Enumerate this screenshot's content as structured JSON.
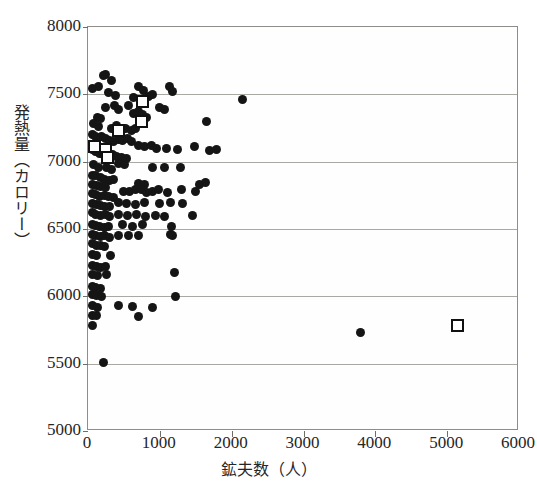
{
  "chart_data": {
    "type": "scatter",
    "title": "",
    "xlabel": "鉱夫数（人）",
    "ylabel": "発熱量（カロリー）",
    "xlim": [
      0,
      6000
    ],
    "ylim": [
      5000,
      8000
    ],
    "xticks": [
      0,
      1000,
      2000,
      3000,
      4000,
      5000,
      6000
    ],
    "yticks": [
      5000,
      5500,
      6000,
      6500,
      7000,
      7500,
      8000
    ],
    "xtick_labels": [
      "0",
      "1000",
      "2000",
      "3000",
      "4000",
      "5000",
      "6000"
    ],
    "ytick_labels": [
      "5000",
      "5500",
      "6000",
      "6500",
      "7000",
      "7500",
      "8000"
    ],
    "grid": "horizontal",
    "legend": [],
    "series": [
      {
        "name": "mines-filled-circle",
        "marker": "filled-circle",
        "color": "#151515",
        "points": [
          [
            60,
            7540
          ],
          [
            215,
            7640
          ],
          [
            250,
            7650
          ],
          [
            330,
            7600
          ],
          [
            140,
            7560
          ],
          [
            290,
            7510
          ],
          [
            380,
            7495
          ],
          [
            700,
            7555
          ],
          [
            770,
            7530
          ],
          [
            640,
            7480
          ],
          [
            840,
            7485
          ],
          [
            900,
            7500
          ],
          [
            1130,
            7560
          ],
          [
            1180,
            7520
          ],
          [
            370,
            7420
          ],
          [
            250,
            7400
          ],
          [
            430,
            7390
          ],
          [
            560,
            7420
          ],
          [
            640,
            7360
          ],
          [
            700,
            7370
          ],
          [
            760,
            7350
          ],
          [
            820,
            7330
          ],
          [
            1000,
            7400
          ],
          [
            1060,
            7390
          ],
          [
            130,
            7330
          ],
          [
            175,
            7320
          ],
          [
            80,
            7280
          ],
          [
            150,
            7260
          ],
          [
            330,
            7250
          ],
          [
            390,
            7270
          ],
          [
            460,
            7240
          ],
          [
            520,
            7250
          ],
          [
            600,
            7230
          ],
          [
            660,
            7250
          ],
          [
            2150,
            7460
          ],
          [
            1650,
            7300
          ],
          [
            60,
            7200
          ],
          [
            110,
            7185
          ],
          [
            185,
            7190
          ],
          [
            240,
            7175
          ],
          [
            300,
            7160
          ],
          [
            360,
            7150
          ],
          [
            420,
            7165
          ],
          [
            480,
            7155
          ],
          [
            545,
            7170
          ],
          [
            610,
            7150
          ],
          [
            700,
            7120
          ],
          [
            780,
            7110
          ],
          [
            880,
            7120
          ],
          [
            960,
            7095
          ],
          [
            1090,
            7100
          ],
          [
            1250,
            7090
          ],
          [
            1480,
            7110
          ],
          [
            1690,
            7080
          ],
          [
            1790,
            7090
          ],
          [
            60,
            7090
          ],
          [
            110,
            7075
          ],
          [
            160,
            7060
          ],
          [
            220,
            7055
          ],
          [
            280,
            7040
          ],
          [
            340,
            7050
          ],
          [
            400,
            7035
          ],
          [
            470,
            7030
          ],
          [
            540,
            7020
          ],
          [
            80,
            6980
          ],
          [
            140,
            6960
          ],
          [
            260,
            6955
          ],
          [
            330,
            6945
          ],
          [
            430,
            6990
          ],
          [
            510,
            6980
          ],
          [
            900,
            6960
          ],
          [
            1060,
            6955
          ],
          [
            1290,
            6960
          ],
          [
            60,
            6900
          ],
          [
            110,
            6895
          ],
          [
            170,
            6880
          ],
          [
            230,
            6870
          ],
          [
            300,
            6860
          ],
          [
            360,
            6865
          ],
          [
            60,
            6830
          ],
          [
            120,
            6820
          ],
          [
            180,
            6815
          ],
          [
            250,
            6810
          ],
          [
            700,
            6840
          ],
          [
            780,
            6830
          ],
          [
            1550,
            6830
          ],
          [
            1640,
            6845
          ],
          [
            60,
            6760
          ],
          [
            110,
            6755
          ],
          [
            165,
            6745
          ],
          [
            225,
            6750
          ],
          [
            290,
            6740
          ],
          [
            350,
            6735
          ],
          [
            500,
            6780
          ],
          [
            580,
            6775
          ],
          [
            660,
            6790
          ],
          [
            740,
            6795
          ],
          [
            820,
            6770
          ],
          [
            900,
            6780
          ],
          [
            980,
            6790
          ],
          [
            1110,
            6770
          ],
          [
            1300,
            6790
          ],
          [
            1500,
            6775
          ],
          [
            60,
            6690
          ],
          [
            115,
            6680
          ],
          [
            170,
            6675
          ],
          [
            230,
            6665
          ],
          [
            300,
            6670
          ],
          [
            420,
            6700
          ],
          [
            540,
            6690
          ],
          [
            660,
            6680
          ],
          [
            790,
            6700
          ],
          [
            1000,
            6690
          ],
          [
            1150,
            6700
          ],
          [
            1320,
            6690
          ],
          [
            60,
            6620
          ],
          [
            110,
            6610
          ],
          [
            170,
            6600
          ],
          [
            240,
            6605
          ],
          [
            300,
            6595
          ],
          [
            430,
            6610
          ],
          [
            550,
            6600
          ],
          [
            680,
            6605
          ],
          [
            800,
            6595
          ],
          [
            940,
            6600
          ],
          [
            1070,
            6595
          ],
          [
            1460,
            6600
          ],
          [
            60,
            6530
          ],
          [
            110,
            6525
          ],
          [
            165,
            6515
          ],
          [
            225,
            6510
          ],
          [
            290,
            6520
          ],
          [
            480,
            6530
          ],
          [
            620,
            6520
          ],
          [
            760,
            6530
          ],
          [
            1160,
            6520
          ],
          [
            60,
            6460
          ],
          [
            110,
            6455
          ],
          [
            170,
            6445
          ],
          [
            230,
            6450
          ],
          [
            300,
            6440
          ],
          [
            430,
            6450
          ],
          [
            570,
            6450
          ],
          [
            700,
            6455
          ],
          [
            1150,
            6460
          ],
          [
            1180,
            6455
          ],
          [
            60,
            6390
          ],
          [
            115,
            6380
          ],
          [
            170,
            6375
          ],
          [
            230,
            6370
          ],
          [
            60,
            6310
          ],
          [
            125,
            6300
          ],
          [
            310,
            6300
          ],
          [
            60,
            6230
          ],
          [
            115,
            6220
          ],
          [
            175,
            6215
          ],
          [
            240,
            6225
          ],
          [
            60,
            6160
          ],
          [
            130,
            6155
          ],
          [
            260,
            6160
          ],
          [
            1200,
            6180
          ],
          [
            60,
            6070
          ],
          [
            110,
            6065
          ],
          [
            170,
            6060
          ],
          [
            1220,
            6000
          ],
          [
            60,
            6010
          ],
          [
            115,
            6005
          ],
          [
            190,
            6000
          ],
          [
            60,
            5930
          ],
          [
            130,
            5920
          ],
          [
            430,
            5930
          ],
          [
            620,
            5925
          ],
          [
            900,
            5920
          ],
          [
            60,
            5860
          ],
          [
            120,
            5855
          ],
          [
            700,
            5850
          ],
          [
            60,
            5780
          ],
          [
            3800,
            5730
          ],
          [
            210,
            5510
          ]
        ]
      },
      {
        "name": "mines-open-square",
        "marker": "open-square",
        "color": "#111111",
        "points": [
          [
            760,
            7450
          ],
          [
            740,
            7300
          ],
          [
            430,
            7230
          ],
          [
            90,
            7115
          ],
          [
            250,
            7090
          ],
          [
            270,
            7030
          ],
          [
            5150,
            5780
          ]
        ]
      }
    ]
  }
}
